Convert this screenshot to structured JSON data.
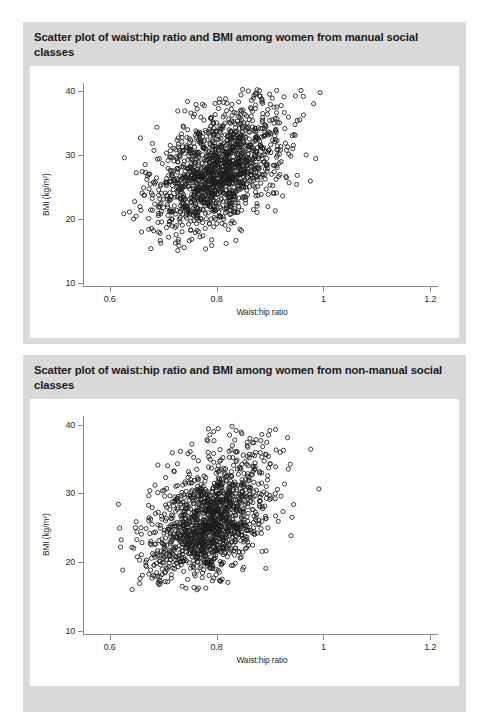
{
  "figures": [
    {
      "id": "manual",
      "title": "Scatter plot of waist:hip ratio and BMI among women from manual social classes"
    },
    {
      "id": "non-manual",
      "title": "Scatter plot of waist:hip ratio and BMI among women from non-manual social classes"
    }
  ],
  "chart_data": [
    {
      "type": "scatter",
      "title": "Scatter plot of waist:hip ratio and BMI among women from manual social classes",
      "xlabel": "Waist:hip ratio",
      "ylabel": "BMI (kg/m²)",
      "xlim": [
        0.55,
        1.22
      ],
      "ylim": [
        9,
        42
      ],
      "xticks": [
        0.6,
        0.8,
        1,
        1.2
      ],
      "xticklabels": [
        "0.6",
        "0.8",
        "1",
        "1.2"
      ],
      "yticks": [
        10,
        20,
        30,
        40
      ],
      "yticklabels": [
        "10",
        "20",
        "30",
        "40"
      ],
      "grid": false,
      "legend": null,
      "marker": "open-circle",
      "marker_color": "#1c1c1c",
      "n_points": 1500,
      "distribution": {
        "x_mean": 0.805,
        "x_sd": 0.062,
        "y_mean": 27.4,
        "y_sd": 4.5,
        "correlation": 0.45,
        "x_clip": [
          0.62,
          1.14
        ],
        "y_clip": [
          14.5,
          40.5
        ]
      },
      "seed": 20117
    },
    {
      "type": "scatter",
      "title": "Scatter plot of waist:hip ratio and BMI among women from non-manual social classes",
      "xlabel": "Waist:hip ratio",
      "ylabel": "BMI (kg/m²)",
      "xlim": [
        0.55,
        1.22
      ],
      "ylim": [
        9,
        42
      ],
      "xticks": [
        0.6,
        0.8,
        1,
        1.2
      ],
      "xticklabels": [
        "0.6",
        "0.8",
        "1",
        "1.2"
      ],
      "yticks": [
        10,
        20,
        30,
        40
      ],
      "yticklabels": [
        "10",
        "20",
        "30",
        "40"
      ],
      "grid": false,
      "legend": null,
      "marker": "open-circle",
      "marker_color": "#1c1c1c",
      "n_points": 1400,
      "distribution": {
        "x_mean": 0.787,
        "x_sd": 0.058,
        "y_mean": 25.8,
        "y_sd": 4.3,
        "correlation": 0.46,
        "x_clip": [
          0.6,
          1.16
        ],
        "y_clip": [
          15.5,
          40.0
        ]
      },
      "seed": 77341
    }
  ]
}
